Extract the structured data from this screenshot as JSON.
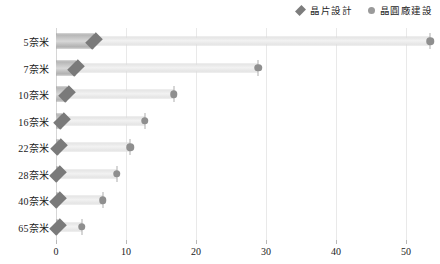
{
  "legend": {
    "position": "top-right",
    "entries": [
      {
        "label": "晶片設計",
        "marker": "diamond-icon",
        "color": "#7d7d7d"
      },
      {
        "label": "晶圓廠建設",
        "marker": "circle-icon",
        "color": "#9a9a9a"
      }
    ]
  },
  "chart_data": {
    "type": "bar",
    "orientation": "horizontal",
    "title": "",
    "xlabel": "",
    "ylabel": "",
    "xlim": [
      0,
      54.3
    ],
    "xticks": [
      0,
      10,
      20,
      30,
      40,
      50
    ],
    "xtick_labels": [
      "0",
      "10",
      "20",
      "30",
      "40",
      "50"
    ],
    "grid": true,
    "categories": [
      "5奈米",
      "7奈米",
      "10奈米",
      "16奈米",
      "22奈米",
      "28奈米",
      "40奈米",
      "65奈米"
    ],
    "series": [
      {
        "name": "晶片設計",
        "marker": "diamond",
        "color": "#7a7a7a",
        "values": [
          5.4,
          2.9,
          1.6,
          0.9,
          0.5,
          0.3,
          0.2,
          0.1
        ]
      },
      {
        "name": "晶圓廠建設",
        "marker": "circle",
        "color": "#8f8f8f",
        "values": [
          53.5,
          28.9,
          16.8,
          12.7,
          10.6,
          8.7,
          6.7,
          3.7
        ]
      }
    ]
  }
}
